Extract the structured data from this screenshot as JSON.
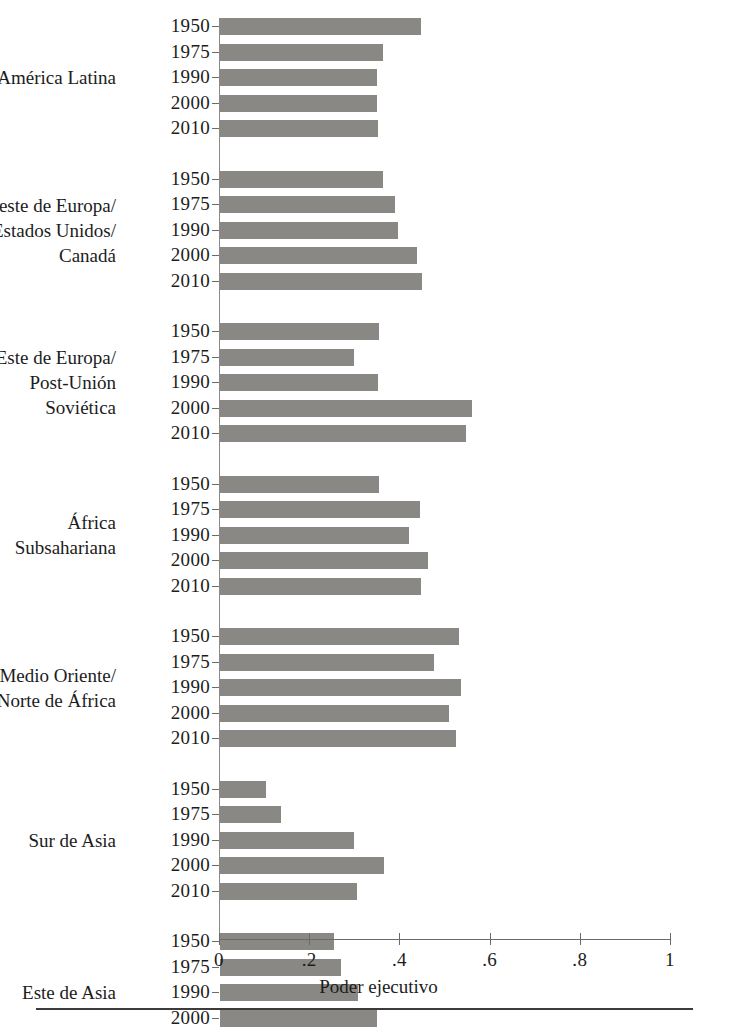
{
  "chart_data": {
    "type": "bar",
    "orientation": "horizontal",
    "title": "",
    "xlabel": "Poder ejecutivo",
    "ylabel": "",
    "xlim": [
      0,
      1
    ],
    "xticks": [
      0,
      0.2,
      0.4,
      0.6,
      0.8,
      1
    ],
    "xticklabels": [
      "0",
      ".2",
      ".4",
      ".6",
      ".8",
      "1"
    ],
    "grid": false,
    "legend": null,
    "bar_color": "#8a8885",
    "axis_color": "#6d6a66",
    "categories": [
      "1950",
      "1975",
      "1990",
      "2000",
      "2010"
    ],
    "groups": [
      {
        "label_lines": [
          "América Latina"
        ],
        "values": [
          0.446,
          0.361,
          0.348,
          0.348,
          0.35
        ]
      },
      {
        "label_lines": [
          "Oeste de Europa/",
          "Estados Unidos/",
          "Canadá"
        ],
        "values": [
          0.361,
          0.388,
          0.395,
          0.437,
          0.448
        ]
      },
      {
        "label_lines": [
          "Este de Europa/",
          "Post-Unión",
          "Soviética"
        ],
        "values": [
          0.353,
          0.297,
          0.35,
          0.559,
          0.546
        ]
      },
      {
        "label_lines": [
          "África",
          "Subsahariana"
        ],
        "values": [
          0.353,
          0.443,
          0.419,
          0.461,
          0.446
        ]
      },
      {
        "label_lines": [
          "Medio Oriente/",
          "Norte de África"
        ],
        "values": [
          0.53,
          0.474,
          0.535,
          0.508,
          0.523
        ]
      },
      {
        "label_lines": [
          "Sur de Asia"
        ],
        "values": [
          0.102,
          0.135,
          0.297,
          0.364,
          0.304
        ]
      },
      {
        "label_lines": [
          "Este de Asia"
        ],
        "values": [
          0.253,
          0.268,
          0.306,
          0.348,
          0.33
        ]
      }
    ]
  },
  "footer": {
    "caption": ""
  }
}
